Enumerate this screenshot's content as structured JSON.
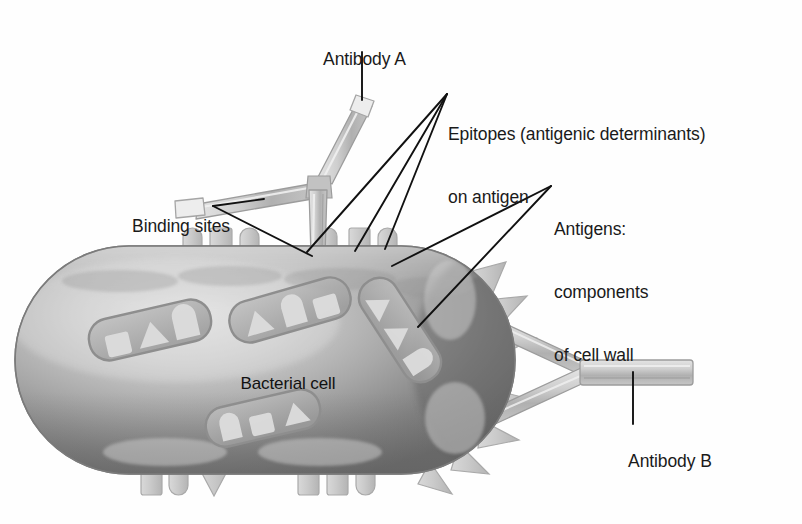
{
  "figure": {
    "background_color": "#fefefe",
    "width": 802,
    "height": 524
  },
  "labels": {
    "antibody_a": "Antibody A",
    "antibody_b": "Antibody B",
    "epitopes_line1": "Epitopes (antigenic determinants)",
    "epitopes_line2": "on antigen",
    "antigens_line1": "Antigens:",
    "antigens_line2": "components",
    "antigens_line3": "of cell wall",
    "binding_sites": "Binding sites",
    "bacterial_cell": "Bacterial cell"
  },
  "colors": {
    "text": "#1a1a1a",
    "leader_line": "#111111",
    "cell_fill_light": "#d8d8d8",
    "cell_fill_mid": "#9a9a9a",
    "cell_fill_dark": "#6f6f6f",
    "cell_outline": "#8a8a8a",
    "antigen_fill": "#c9c9c9",
    "antigen_outline": "#a8a8a8",
    "antibody_fill": "#c4c4c4",
    "antibody_outline": "#9c9c9c",
    "antibody_highlight": "#e2e2e2",
    "patch_fill": "#a9a9a9",
    "patch_shape_fill": "#d6d6d6"
  },
  "structures": {
    "bacterial_cell": {
      "name": "Bacterial cell",
      "shape": "rod / capsule",
      "center_x": 265,
      "center_y": 360,
      "width": 500,
      "height": 228
    },
    "antibody_a": {
      "name": "Antibody A",
      "shape": "Y-shaped immunoglobulin",
      "orientation": "tilted, stem down onto top of cell",
      "arms": 2,
      "binding_sites": 2
    },
    "antibody_b": {
      "name": "Antibody B",
      "shape": "Y-shaped immunoglobulin",
      "orientation": "horizontal, stem to the right of cell",
      "arms": 2,
      "binding_sites": 2
    },
    "surface_antigens": {
      "description": "Blocks and spikes protruding from cell wall",
      "top_count": 6,
      "bottom_count": 7,
      "right_spike_count": 7,
      "left_count": 3
    },
    "membrane_patches": {
      "description": "Capsule-shaped patches in cell wall containing square, triangle and dome epitopes",
      "count": 4
    }
  },
  "leader_lines": {
    "antibody_a": "vertical line from label down to antibody A stem",
    "epitopes": "three lines fanning to three surface antigens",
    "antigens": "two lines to cell wall and to a membrane patch",
    "binding_sites": "two lines to the two arm tips of antibody A",
    "antibody_b": "vertical line from label up to antibody B stem"
  }
}
